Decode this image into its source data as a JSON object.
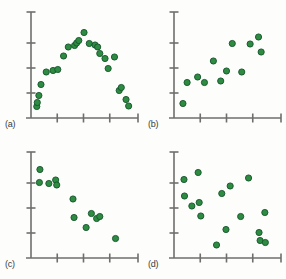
{
  "figure": {
    "width": 286,
    "height": 279,
    "background_color": "#fdfdfb",
    "axis_color": "#6e6e6e",
    "point_fill": "#2e8b42",
    "point_stroke": "#14532a",
    "point_radius": 3.1,
    "label_color": "#3b3b3b"
  },
  "panels": [
    {
      "key": "a",
      "label": "(a)"
    },
    {
      "key": "b",
      "label": "(b)"
    },
    {
      "key": "c",
      "label": "(c)"
    },
    {
      "key": "d",
      "label": "(d)"
    }
  ],
  "chart_data": [
    {
      "type": "scatter",
      "panel": "(a)",
      "title": "",
      "xlabel": "",
      "ylabel": "",
      "xlim": [
        0,
        10
      ],
      "ylim": [
        0,
        10
      ],
      "grid": false,
      "legend": "none",
      "xticks": [
        2.5,
        5.0,
        7.5
      ],
      "yticks": [
        2.5,
        5.0,
        7.5
      ],
      "relationship": "curvilinear-inverted-u",
      "x": [
        0.55,
        0.6,
        0.75,
        0.95,
        1.45,
        2.1,
        2.55,
        3.1,
        3.55,
        4.15,
        4.35,
        4.55,
        5.05,
        5.55,
        6.1,
        6.35,
        6.55,
        7.05,
        7.35,
        7.95,
        8.4,
        8.6,
        9.05,
        9.3
      ],
      "y": [
        1.15,
        1.55,
        2.25,
        3.35,
        4.6,
        4.75,
        4.85,
        6.2,
        7.1,
        7.25,
        7.5,
        7.75,
        8.55,
        7.45,
        7.3,
        7.1,
        6.45,
        5.95,
        4.95,
        6.1,
        2.75,
        3.05,
        1.85,
        1.2
      ]
    },
    {
      "type": "scatter",
      "panel": "(b)",
      "title": "",
      "xlabel": "",
      "ylabel": "",
      "xlim": [
        0,
        10
      ],
      "ylim": [
        0,
        10
      ],
      "grid": false,
      "legend": "none",
      "xticks": [
        2.5,
        5.0,
        7.5
      ],
      "yticks": [
        2.5,
        5.0,
        7.5
      ],
      "relationship": "positive-moderate",
      "x": [
        0.85,
        1.25,
        2.25,
        2.9,
        3.75,
        4.45,
        5.0,
        5.55,
        6.45,
        7.25,
        8.05,
        8.3
      ],
      "y": [
        1.45,
        3.55,
        4.1,
        3.55,
        5.7,
        3.7,
        4.7,
        7.45,
        4.6,
        7.4,
        8.1,
        6.6
      ]
    },
    {
      "type": "scatter",
      "panel": "(c)",
      "title": "",
      "xlabel": "",
      "ylabel": "",
      "xlim": [
        0,
        10
      ],
      "ylim": [
        0,
        10
      ],
      "grid": false,
      "legend": "none",
      "xticks": [
        2.5,
        5.0,
        7.5
      ],
      "yticks": [
        2.5,
        5.0,
        7.5
      ],
      "relationship": "negative-strong",
      "x": [
        0.85,
        0.8,
        1.7,
        2.35,
        2.45,
        4.0,
        4.1,
        5.25,
        5.75,
        6.25,
        6.55,
        8.05
      ],
      "y": [
        8.85,
        7.55,
        7.45,
        7.8,
        7.3,
        5.9,
        4.05,
        3.05,
        4.45,
        3.95,
        4.15,
        1.95
      ]
    },
    {
      "type": "scatter",
      "panel": "(d)",
      "title": "",
      "xlabel": "",
      "ylabel": "",
      "xlim": [
        0,
        10
      ],
      "ylim": [
        0,
        10
      ],
      "grid": false,
      "legend": "none",
      "xticks": [
        2.5,
        5.0,
        7.5
      ],
      "yticks": [
        2.5,
        5.0,
        7.5
      ],
      "relationship": "no-correlation",
      "x": [
        0.95,
        1.0,
        1.7,
        2.3,
        2.4,
        2.55,
        4.05,
        4.55,
        4.95,
        5.35,
        6.35,
        7.1,
        8.1,
        8.2,
        8.65,
        8.7
      ],
      "y": [
        7.85,
        6.2,
        5.2,
        8.55,
        5.55,
        4.2,
        1.3,
        6.45,
        2.85,
        7.2,
        4.15,
        8.0,
        2.55,
        1.75,
        4.55,
        1.55
      ]
    }
  ]
}
